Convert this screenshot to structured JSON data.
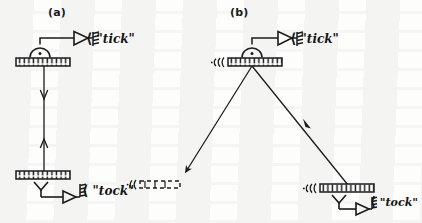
{
  "figure": {
    "ink_color": "#1b1b1b",
    "background_color": "#fdfdfc"
  },
  "panels": [
    {
      "id": "a",
      "label": "(a)",
      "label_pos": {
        "x": 48,
        "y": 6
      },
      "description": "Stationary light clock: vertical beam bounces between two parallel mirrors",
      "mirrors": [
        {
          "name": "top-mirror",
          "x": 16,
          "y": 58,
          "w": 54,
          "h": 8,
          "hatched": true,
          "incoming_wave": false
        },
        {
          "name": "bottom-mirror",
          "x": 16,
          "y": 171,
          "w": 54,
          "h": 8,
          "hatched": true,
          "incoming_wave": false
        }
      ],
      "beams": [
        {
          "name": "beam-downward",
          "x1": 44,
          "y1": 66,
          "x2": 44,
          "y2": 172,
          "arrow": "down",
          "arrow_at": 0.27
        },
        {
          "name": "beam-upward",
          "x1": 44,
          "y1": 171,
          "x2": 44,
          "y2": 66,
          "arrow": "up",
          "arrow_at": 0.28
        }
      ],
      "messages": [
        {
          "name": "tick-message",
          "text": "\"tick\"",
          "x": 92,
          "y": 33
        },
        {
          "name": "tock-message",
          "text": "\"tock\"",
          "x": 86,
          "y": 184
        }
      ],
      "ghost_mirror": {
        "name": "ghost-mirror-dashed",
        "x": 136,
        "y": 182,
        "w": 44,
        "h": 8,
        "dashed": true,
        "wave_marks": true
      }
    },
    {
      "id": "b",
      "label": "(b)",
      "label_pos": {
        "x": 230,
        "y": 6
      },
      "description": "Moving light clock: beam travels along slanted paths between displaced mirrors",
      "mirrors": [
        {
          "name": "top-mirror",
          "x": 228,
          "y": 58,
          "w": 54,
          "h": 8,
          "hatched": true,
          "incoming_wave": true
        },
        {
          "name": "bottom-mirror",
          "x": 320,
          "y": 184,
          "w": 54,
          "h": 8,
          "hatched": true,
          "incoming_wave": true
        }
      ],
      "beams": [
        {
          "name": "beam-incoming-left",
          "x1": 252,
          "y1": 66,
          "x2": 186,
          "y2": 170,
          "arrow": "down-left",
          "arrow_at": 1.0
        },
        {
          "name": "beam-outgoing-right",
          "x1": 252,
          "y1": 66,
          "x2": 348,
          "y2": 184,
          "arrow": "down-right",
          "arrow_at": 0.62
        }
      ],
      "messages": [
        {
          "name": "tick-message",
          "text": "\"tick\"",
          "x": 296,
          "y": 33
        },
        {
          "name": "tock-message",
          "text": "\"tock\"",
          "x": 376,
          "y": 196
        }
      ]
    }
  ],
  "symbols": {
    "detector": {
      "name": "detector-semicircle",
      "description": "half-disc photodetector with centre dot attached to mirror"
    },
    "amplifier": {
      "name": "amplifier-triangle",
      "description": "triangular amplifier / buffer symbol"
    },
    "antenna": {
      "name": "antenna-coil",
      "description": "coil/spring transmitter emitting a message"
    },
    "emitter": {
      "name": "emitter-y-symbol",
      "description": "Y shaped light emitter under the lower mirror"
    },
    "radiation": {
      "name": "radiation-arcs-icon",
      "description": "small arcs indicating incoming radiation at mirror edge"
    },
    "speech_bracket": {
      "name": "speech-bracket-icon",
      "glyph": "⟨"
    }
  }
}
